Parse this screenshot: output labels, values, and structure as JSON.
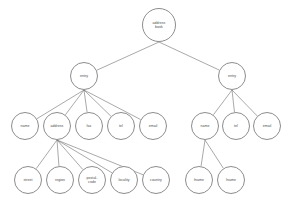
{
  "diagram": {
    "type": "tree",
    "title": "address book",
    "canvas": {
      "width": 297,
      "height": 209
    },
    "style": {
      "background_color": "#ffffff",
      "node_fill": "#ffffff",
      "node_stroke": "#8d8d8d",
      "edge_stroke": "#6e6e6e",
      "label_color": "#4a4a4a"
    },
    "nodes": [
      {
        "id": "root",
        "label": "address\nbook",
        "cx": 159,
        "cy": 25,
        "r": 17,
        "level": 0
      },
      {
        "id": "entry-left",
        "label": "entry",
        "cx": 84,
        "cy": 76,
        "r": 14,
        "level": 1
      },
      {
        "id": "entry-right",
        "label": "entry",
        "cx": 232,
        "cy": 76,
        "r": 14,
        "level": 1
      },
      {
        "id": "l-name",
        "label": "name",
        "cx": 25,
        "cy": 126,
        "r": 14,
        "level": 2
      },
      {
        "id": "l-address",
        "label": "address",
        "cx": 57,
        "cy": 126,
        "r": 14,
        "level": 2
      },
      {
        "id": "l-fax",
        "label": "fax",
        "cx": 89,
        "cy": 126,
        "r": 14,
        "level": 2
      },
      {
        "id": "l-tel",
        "label": "tel",
        "cx": 121,
        "cy": 126,
        "r": 14,
        "level": 2
      },
      {
        "id": "l-email",
        "label": "email",
        "cx": 153,
        "cy": 126,
        "r": 14,
        "level": 2
      },
      {
        "id": "r-name",
        "label": "name",
        "cx": 205,
        "cy": 126,
        "r": 14,
        "level": 2
      },
      {
        "id": "r-tel",
        "label": "tel",
        "cx": 236,
        "cy": 126,
        "r": 14,
        "level": 2
      },
      {
        "id": "r-email",
        "label": "email",
        "cx": 267,
        "cy": 126,
        "r": 14,
        "level": 2
      },
      {
        "id": "a-street",
        "label": "street",
        "cx": 28,
        "cy": 180,
        "r": 14,
        "level": 3
      },
      {
        "id": "a-region",
        "label": "region",
        "cx": 60,
        "cy": 180,
        "r": 14,
        "level": 3
      },
      {
        "id": "a-postal",
        "label": "postal-\ncode",
        "cx": 92,
        "cy": 180,
        "r": 14,
        "level": 3
      },
      {
        "id": "a-locality",
        "label": "locality",
        "cx": 124,
        "cy": 180,
        "r": 14,
        "level": 3
      },
      {
        "id": "a-country",
        "label": "country",
        "cx": 156,
        "cy": 180,
        "r": 14,
        "level": 3
      },
      {
        "id": "n-fname",
        "label": "fname",
        "cx": 199,
        "cy": 180,
        "r": 14,
        "level": 3
      },
      {
        "id": "n-lname",
        "label": "lname",
        "cx": 231,
        "cy": 180,
        "r": 14,
        "level": 3
      }
    ],
    "edges": [
      {
        "from": "root",
        "to": "entry-left"
      },
      {
        "from": "root",
        "to": "entry-right"
      },
      {
        "from": "entry-left",
        "to": "l-name"
      },
      {
        "from": "entry-left",
        "to": "l-address"
      },
      {
        "from": "entry-left",
        "to": "l-fax"
      },
      {
        "from": "entry-left",
        "to": "l-tel"
      },
      {
        "from": "entry-left",
        "to": "l-email"
      },
      {
        "from": "entry-right",
        "to": "r-name"
      },
      {
        "from": "entry-right",
        "to": "r-tel"
      },
      {
        "from": "entry-right",
        "to": "r-email"
      },
      {
        "from": "l-address",
        "to": "a-street"
      },
      {
        "from": "l-address",
        "to": "a-region"
      },
      {
        "from": "l-address",
        "to": "a-postal"
      },
      {
        "from": "l-address",
        "to": "a-locality"
      },
      {
        "from": "l-address",
        "to": "a-country"
      },
      {
        "from": "r-name",
        "to": "n-fname"
      },
      {
        "from": "r-name",
        "to": "n-lname"
      }
    ]
  }
}
